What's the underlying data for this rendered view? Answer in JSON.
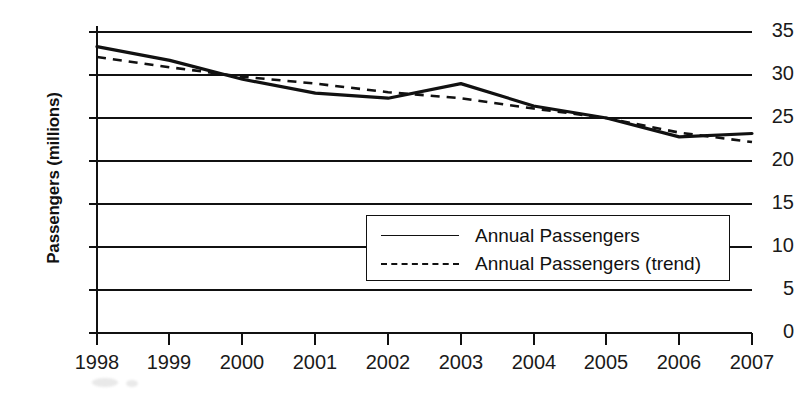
{
  "chart_data": {
    "type": "line",
    "title": "",
    "subtitle": "",
    "xlabel": "",
    "ylabel": "Passengers (millions)",
    "categories": [
      "1998",
      "1999",
      "2000",
      "2001",
      "2002",
      "2003",
      "2004",
      "2005",
      "2006",
      "2007"
    ],
    "x": [
      1998,
      1999,
      2000,
      2001,
      2002,
      2003,
      2004,
      2005,
      2006,
      2007
    ],
    "xlim": [
      1998,
      2007
    ],
    "ylim": [
      0,
      35
    ],
    "yticks": [
      0,
      5,
      10,
      15,
      20,
      25,
      30,
      35
    ],
    "ytick_labels": [
      "0",
      "5",
      "10",
      "15",
      "20",
      "25",
      "30",
      "35"
    ],
    "xtick_labels": [
      "1998",
      "1999",
      "2000",
      "2001",
      "2002",
      "2003",
      "2004",
      "2005",
      "2006",
      "2007"
    ],
    "grid": "horizontal",
    "legend_position": "lower-right-inside",
    "series": [
      {
        "name": "Annual Passengers",
        "style": "solid",
        "color": "#111111",
        "values": [
          33.3,
          31.7,
          29.5,
          27.9,
          27.3,
          29.0,
          26.4,
          25.0,
          22.8,
          23.2
        ]
      },
      {
        "name": "Annual Passengers (trend)",
        "style": "dashed",
        "color": "#111111",
        "values": [
          32.1,
          30.9,
          29.8,
          29.0,
          28.0,
          27.3,
          26.1,
          25.0,
          23.3,
          22.2
        ]
      }
    ]
  },
  "legend": {
    "items": [
      {
        "label": "Annual Passengers",
        "swatch": "solid-line-swatch"
      },
      {
        "label": "Annual Passengers (trend)",
        "swatch": "dashed-line-swatch"
      }
    ]
  },
  "axes": {
    "y_title": "Passengers (millions)"
  }
}
